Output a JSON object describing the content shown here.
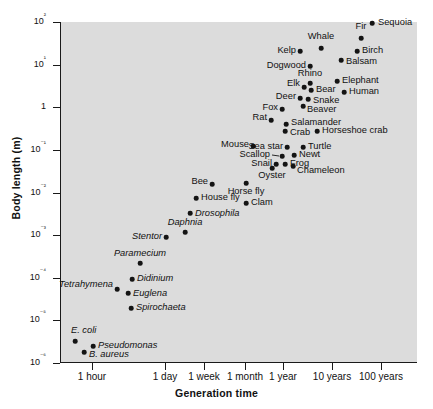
{
  "chart_data": {
    "type": "scatter",
    "title": "",
    "xlabel": "Generation time",
    "ylabel": "Body length (m)",
    "xscale": "log",
    "yscale": "log",
    "grid": false,
    "legend": null,
    "background_color": "#dcdcdc",
    "point_color": "#141414",
    "xtick_labels": [
      "1 hour",
      "1 day",
      "1 week",
      "1 month",
      "1 year",
      "10 years",
      "100 years"
    ],
    "xtick_px": [
      92,
      165,
      204,
      245,
      283,
      332,
      381
    ],
    "ytick_labels": [
      "10²",
      "10¹",
      "1",
      "10⁻¹",
      "10⁻²",
      "10⁻³",
      "10⁻⁴",
      "10⁻⁵",
      "10⁻⁶"
    ],
    "ytick_values": [
      100,
      10,
      1,
      0.1,
      0.01,
      0.001,
      0.0001,
      1e-05,
      1e-06
    ],
    "ylim": [
      1e-06,
      100
    ],
    "points": [
      {
        "name": "Sequoia",
        "label": "Sequoia",
        "x": 372,
        "y": 23,
        "lx": 378,
        "ly": 23,
        "side": "l",
        "italic": false
      },
      {
        "name": "Fir",
        "label": "Fir",
        "x": 361,
        "y": 38,
        "lx": 361,
        "ly": 27,
        "side": "c",
        "italic": false
      },
      {
        "name": "Whale",
        "label": "Whale",
        "x": 321,
        "y": 48,
        "lx": 321,
        "ly": 37,
        "side": "c",
        "italic": false
      },
      {
        "name": "Birch",
        "label": "Birch",
        "x": 357,
        "y": 51,
        "lx": 362,
        "ly": 51,
        "side": "l",
        "italic": false
      },
      {
        "name": "Kelp",
        "label": "Kelp",
        "x": 300,
        "y": 51,
        "lx": 296,
        "ly": 51,
        "side": "r",
        "italic": false
      },
      {
        "name": "Balsam",
        "label": "Balsam",
        "x": 341,
        "y": 60,
        "lx": 346,
        "ly": 62,
        "side": "l",
        "italic": false
      },
      {
        "name": "Dogwood",
        "label": "Dogwood",
        "x": 310,
        "y": 66,
        "lx": 306,
        "ly": 66,
        "side": "r",
        "italic": false
      },
      {
        "name": "Elephant",
        "label": "Elephant",
        "x": 337,
        "y": 81,
        "lx": 342,
        "ly": 81,
        "side": "l",
        "italic": false
      },
      {
        "name": "Rhino",
        "label": "Rhino",
        "x": 310,
        "y": 83,
        "lx": 310,
        "ly": 74,
        "side": "c",
        "italic": false
      },
      {
        "name": "Elk",
        "label": "Elk",
        "x": 304,
        "y": 87,
        "lx": 300,
        "ly": 84,
        "side": "r",
        "italic": false
      },
      {
        "name": "Bear",
        "label": "Bear",
        "x": 311,
        "y": 90,
        "lx": 316,
        "ly": 90,
        "side": "l",
        "italic": false
      },
      {
        "name": "Human",
        "label": "Human",
        "x": 344,
        "y": 92,
        "lx": 349,
        "ly": 92,
        "side": "l",
        "italic": false
      },
      {
        "name": "Deer",
        "label": "Deer",
        "x": 300,
        "y": 98,
        "lx": 296,
        "ly": 97,
        "side": "r",
        "italic": false
      },
      {
        "name": "Snake",
        "label": "Snake",
        "x": 308,
        "y": 99,
        "lx": 313,
        "ly": 101,
        "side": "l",
        "italic": false
      },
      {
        "name": "Beaver",
        "label": "Beaver",
        "x": 303,
        "y": 106,
        "lx": 307,
        "ly": 110,
        "side": "l",
        "italic": false
      },
      {
        "name": "Fox",
        "label": "Fox",
        "x": 282,
        "y": 109,
        "lx": 278,
        "ly": 108,
        "side": "r",
        "italic": false
      },
      {
        "name": "Rat",
        "label": "Rat",
        "x": 271,
        "y": 120,
        "lx": 267,
        "ly": 118,
        "side": "r",
        "italic": false
      },
      {
        "name": "Salamander",
        "label": "Salamander",
        "x": 286,
        "y": 124,
        "lx": 291,
        "ly": 123,
        "side": "l",
        "italic": false
      },
      {
        "name": "Crab",
        "label": "Crab",
        "x": 285,
        "y": 131,
        "lx": 290,
        "ly": 133,
        "side": "l",
        "italic": false
      },
      {
        "name": "Horseshoe crab",
        "label": "Horseshoe crab",
        "x": 317,
        "y": 131,
        "lx": 322,
        "ly": 131,
        "side": "l",
        "italic": false
      },
      {
        "name": "Mouse",
        "label": "Mouse",
        "x": 253,
        "y": 146,
        "lx": 249,
        "ly": 145,
        "side": "r",
        "italic": false
      },
      {
        "name": "Sea star",
        "label": "Sea star",
        "x": 287,
        "y": 147,
        "lx": 283,
        "ly": 147,
        "side": "r",
        "italic": false
      },
      {
        "name": "Turtle",
        "label": "Turtle",
        "x": 303,
        "y": 147,
        "lx": 308,
        "ly": 147,
        "side": "l",
        "italic": false
      },
      {
        "name": "Newt",
        "label": "Newt",
        "x": 294,
        "y": 155,
        "lx": 299,
        "ly": 155,
        "side": "l",
        "italic": false
      },
      {
        "name": "Scallop",
        "label": "Scallop",
        "x": 282,
        "y": 156,
        "lx": 270,
        "ly": 155,
        "side": "r",
        "italic": false,
        "leader": true
      },
      {
        "name": "Frog",
        "label": "Frog",
        "x": 285,
        "y": 164,
        "lx": 290,
        "ly": 164,
        "side": "l",
        "italic": false
      },
      {
        "name": "Snail",
        "label": "Snail",
        "x": 276,
        "y": 164,
        "lx": 272,
        "ly": 164,
        "side": "r",
        "italic": false
      },
      {
        "name": "Chameleon",
        "label": "Chameleon",
        "x": 293,
        "y": 166,
        "lx": 297,
        "ly": 171,
        "side": "l",
        "italic": false
      },
      {
        "name": "Oyster",
        "label": "Oyster",
        "x": 272,
        "y": 168,
        "lx": 272,
        "ly": 176,
        "side": "c",
        "italic": false
      },
      {
        "name": "Bee",
        "label": "Bee",
        "x": 212,
        "y": 184,
        "lx": 208,
        "ly": 182,
        "side": "r",
        "italic": false
      },
      {
        "name": "Horse fly",
        "label": "Horse fly",
        "x": 246,
        "y": 183,
        "lx": 246,
        "ly": 192,
        "side": "c",
        "italic": false
      },
      {
        "name": "Clam",
        "label": "Clam",
        "x": 246,
        "y": 203,
        "lx": 251,
        "ly": 203,
        "side": "l",
        "italic": false
      },
      {
        "name": "House fly",
        "label": "House fly",
        "x": 196,
        "y": 198,
        "lx": 201,
        "ly": 198,
        "side": "l",
        "italic": false
      },
      {
        "name": "Drosophila",
        "label": "Drosophila",
        "x": 190,
        "y": 213,
        "lx": 195,
        "ly": 214,
        "side": "l",
        "italic": true
      },
      {
        "name": "Daphnia",
        "label": "Daphnia",
        "x": 185,
        "y": 232,
        "lx": 185,
        "ly": 223,
        "side": "c",
        "italic": true
      },
      {
        "name": "Stentor",
        "label": "Stentor",
        "x": 166,
        "y": 237,
        "lx": 162,
        "ly": 237,
        "side": "r",
        "italic": true
      },
      {
        "name": "Paramecium",
        "label": "Paramecium",
        "x": 140,
        "y": 263,
        "lx": 140,
        "ly": 254,
        "side": "c",
        "italic": true
      },
      {
        "name": "Didinium",
        "label": "Didinium",
        "x": 132,
        "y": 279,
        "lx": 137,
        "ly": 279,
        "side": "l",
        "italic": true
      },
      {
        "name": "Tetrahymena",
        "label": "Tetrahymena",
        "x": 117,
        "y": 289,
        "lx": 113,
        "ly": 285,
        "side": "r",
        "italic": true
      },
      {
        "name": "Euglena",
        "label": "Euglena",
        "x": 128,
        "y": 293,
        "lx": 133,
        "ly": 294,
        "side": "l",
        "italic": true
      },
      {
        "name": "Spirochaeta",
        "label": "Spirochaeta",
        "x": 131,
        "y": 308,
        "lx": 136,
        "ly": 308,
        "side": "l",
        "italic": true
      },
      {
        "name": "E. coli",
        "label": "E. coli",
        "x": 75,
        "y": 341,
        "lx": 71,
        "ly": 331,
        "side": "l",
        "italic": true
      },
      {
        "name": "Pseudomonas",
        "label": "Pseudomonas",
        "x": 93,
        "y": 346,
        "lx": 98,
        "ly": 346,
        "side": "l",
        "italic": true
      },
      {
        "name": "B. aureus",
        "label": "B. aureus",
        "x": 84,
        "y": 352,
        "lx": 89,
        "ly": 355,
        "side": "l",
        "italic": true
      }
    ]
  }
}
